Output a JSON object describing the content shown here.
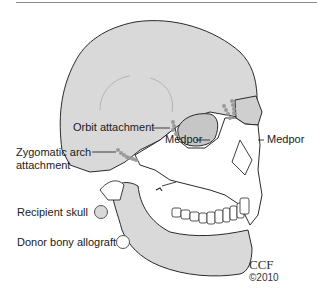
{
  "diagram": {
    "labels": {
      "orbit_attachment": "Orbit attachment",
      "medpor_left": "Medpor",
      "medpor_right": "Medpor",
      "zygomatic_line1": "Zygomatic arch",
      "zygomatic_line2": "attachment"
    },
    "legend": [
      {
        "label": "Recipient skull",
        "color": "#d9d9d9"
      },
      {
        "label": "Donor bony allograft",
        "color": "#ffffff"
      }
    ],
    "credit": {
      "org": "CCF",
      "year": "©2010"
    },
    "colors": {
      "recipient_fill": "#d9d9d9",
      "donor_fill": "#ffffff",
      "outline": "#2a2a2a",
      "attachment_dots": "#9a9a9a",
      "medpor_fill": "#bdbdbd"
    }
  }
}
